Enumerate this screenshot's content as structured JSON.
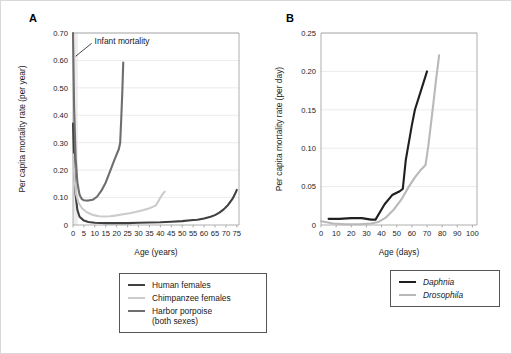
{
  "figure": {
    "panels": [
      {
        "id": "A",
        "label": "A",
        "annotation": {
          "text": "Infant mortality",
          "x": 1.2,
          "y": 0.615
        },
        "legend": {
          "items": [
            {
              "label": "Human females",
              "color": "#404040",
              "italic": false
            },
            {
              "label": "Chimpanzee females",
              "color": "#cbcbcb",
              "italic": false
            },
            {
              "label": "Harbor porpoise\n(both sexes)",
              "color": "#6e6e6e",
              "italic": false
            }
          ]
        },
        "chart_data": {
          "type": "line",
          "title": "",
          "xlabel": "Age (years)",
          "ylabel": "Per capita mortality rate (per year)",
          "xlim": [
            0,
            76
          ],
          "ylim": [
            0,
            0.7
          ],
          "xticks": [
            0,
            5,
            10,
            15,
            20,
            25,
            30,
            35,
            40,
            45,
            50,
            55,
            60,
            65,
            70,
            75
          ],
          "xticklabels": [
            "0",
            "5",
            "10",
            "15",
            "20",
            "25",
            "30",
            "35",
            "40",
            "45",
            "50",
            "55",
            "60",
            "65",
            "70",
            "75"
          ],
          "yticks": [
            0,
            0.1,
            0.2,
            0.3,
            0.4,
            0.5,
            0.6,
            0.7
          ],
          "yticklabels": [
            "0",
            "0.10",
            "0.20",
            "0.30",
            "0.40",
            "0.50",
            "0.60",
            "0.70"
          ],
          "grid": "horizontal",
          "legend_position": "below",
          "series": [
            {
              "name": "Human females",
              "color": "#404040",
              "width": 2.1,
              "points": [
                [
                  0,
                  0.37
                ],
                [
                  0.6,
                  0.205
                ],
                [
                  1.2,
                  0.11
                ],
                [
                  2,
                  0.055
                ],
                [
                  3,
                  0.03
                ],
                [
                  5,
                  0.016
                ],
                [
                  7,
                  0.011
                ],
                [
                  10,
                  0.008
                ],
                [
                  15,
                  0.007
                ],
                [
                  20,
                  0.007
                ],
                [
                  25,
                  0.007
                ],
                [
                  30,
                  0.008
                ],
                [
                  35,
                  0.009
                ],
                [
                  40,
                  0.01
                ],
                [
                  45,
                  0.012
                ],
                [
                  50,
                  0.014
                ],
                [
                  55,
                  0.018
                ],
                [
                  57,
                  0.019
                ],
                [
                  60,
                  0.024
                ],
                [
                  63,
                  0.03
                ],
                [
                  65,
                  0.036
                ],
                [
                  67,
                  0.045
                ],
                [
                  69,
                  0.057
                ],
                [
                  71,
                  0.073
                ],
                [
                  73,
                  0.095
                ],
                [
                  74,
                  0.11
                ],
                [
                  75,
                  0.128
                ]
              ]
            },
            {
              "name": "Chimpanzee females",
              "color": "#cbcbcb",
              "width": 2.1,
              "points": [
                [
                  0,
                  0.258
                ],
                [
                  0.7,
                  0.165
                ],
                [
                  1.5,
                  0.11
                ],
                [
                  2.5,
                  0.082
                ],
                [
                  4,
                  0.062
                ],
                [
                  6,
                  0.048
                ],
                [
                  8,
                  0.04
                ],
                [
                  10,
                  0.035
                ],
                [
                  12,
                  0.032
                ],
                [
                  14,
                  0.031
                ],
                [
                  17,
                  0.032
                ],
                [
                  20,
                  0.035
                ],
                [
                  23,
                  0.039
                ],
                [
                  26,
                  0.043
                ],
                [
                  29,
                  0.048
                ],
                [
                  32,
                  0.054
                ],
                [
                  35,
                  0.061
                ],
                [
                  37,
                  0.068
                ],
                [
                  38,
                  0.072
                ],
                [
                  39,
                  0.086
                ],
                [
                  40,
                  0.1
                ],
                [
                  41,
                  0.112
                ],
                [
                  42,
                  0.122
                ]
              ]
            },
            {
              "name": "Harbor porpoise (both sexes)",
              "color": "#6e6e6e",
              "width": 2.1,
              "points": [
                [
                  0,
                  0.7
                ],
                [
                  0.5,
                  0.43
                ],
                [
                  1.2,
                  0.245
                ],
                [
                  2,
                  0.155
                ],
                [
                  3,
                  0.11
                ],
                [
                  4,
                  0.095
                ],
                [
                  5,
                  0.09
                ],
                [
                  7,
                  0.089
                ],
                [
                  9,
                  0.092
                ],
                [
                  11,
                  0.103
                ],
                [
                  13,
                  0.125
                ],
                [
                  15,
                  0.155
                ],
                [
                  17,
                  0.196
                ],
                [
                  19,
                  0.238
                ],
                [
                  21,
                  0.277
                ],
                [
                  21.6,
                  0.3
                ],
                [
                  22.1,
                  0.39
                ],
                [
                  22.6,
                  0.49
                ],
                [
                  23,
                  0.592
                ]
              ]
            }
          ]
        }
      },
      {
        "id": "B",
        "label": "B",
        "legend": {
          "items": [
            {
              "label": "Daphnia",
              "color": "#1f1f1f",
              "italic": true
            },
            {
              "label": "Drosophila",
              "color": "#b9b9b9",
              "italic": true
            }
          ]
        },
        "chart_data": {
          "type": "line",
          "title": "",
          "xlabel": "Age (days)",
          "ylabel": "Per capita mortality rate (per day)",
          "xlim": [
            0,
            103
          ],
          "ylim": [
            0,
            0.25
          ],
          "xticks": [
            0,
            10,
            20,
            30,
            40,
            50,
            60,
            70,
            80,
            90,
            100
          ],
          "xticklabels": [
            "0",
            "10",
            "20",
            "30",
            "40",
            "50",
            "60",
            "70",
            "80",
            "90",
            "100"
          ],
          "yticks": [
            0,
            0.05,
            0.1,
            0.15,
            0.2,
            0.25
          ],
          "yticklabels": [
            "0",
            "0.05",
            "0.10",
            "0.15",
            "0.20",
            "0.25"
          ],
          "grid": "horizontal",
          "legend_position": "below",
          "series": [
            {
              "name": "Daphnia",
              "color": "#1f1f1f",
              "width": 2.1,
              "points": [
                [
                  5,
                  0.008
                ],
                [
                  12,
                  0.008
                ],
                [
                  20,
                  0.009
                ],
                [
                  27,
                  0.009
                ],
                [
                  33,
                  0.007
                ],
                [
                  36,
                  0.007
                ],
                [
                  42,
                  0.027
                ],
                [
                  47,
                  0.039
                ],
                [
                  52,
                  0.044
                ],
                [
                  54,
                  0.047
                ],
                [
                  56,
                  0.085
                ],
                [
                  60,
                  0.13
                ],
                [
                  62,
                  0.15
                ],
                [
                  66,
                  0.175
                ],
                [
                  70,
                  0.2
                ]
              ]
            },
            {
              "name": "Drosophila",
              "color": "#b9b9b9",
              "width": 2.1,
              "points": [
                [
                  0,
                  0.005
                ],
                [
                  8,
                  0.002
                ],
                [
                  16,
                  0.001
                ],
                [
                  25,
                  0.001
                ],
                [
                  33,
                  0.002
                ],
                [
                  38,
                  0.004
                ],
                [
                  43,
                  0.01
                ],
                [
                  48,
                  0.02
                ],
                [
                  53,
                  0.033
                ],
                [
                  58,
                  0.05
                ],
                [
                  62,
                  0.062
                ],
                [
                  66,
                  0.072
                ],
                [
                  69,
                  0.078
                ],
                [
                  71,
                  0.105
                ],
                [
                  74,
                  0.155
                ],
                [
                  76,
                  0.19
                ],
                [
                  78,
                  0.221
                ]
              ]
            }
          ]
        }
      }
    ]
  }
}
